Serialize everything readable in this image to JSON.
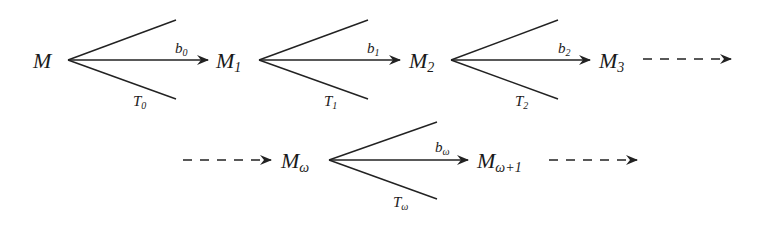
{
  "diagram": {
    "type": "chain-of-forking-morphisms",
    "row1": {
      "nodes": [
        {
          "id": "M",
          "base": "M",
          "sub": ""
        },
        {
          "id": "M1",
          "base": "M",
          "sub": "1"
        },
        {
          "id": "M2",
          "base": "M",
          "sub": "2"
        },
        {
          "id": "M3",
          "base": "M",
          "sub": "3"
        }
      ],
      "forks": [
        {
          "from": "M",
          "to": "M1",
          "arrow_label_base": "b",
          "arrow_label_sub": "0",
          "lower_label_base": "T",
          "lower_label_sub": "0"
        },
        {
          "from": "M1",
          "to": "M2",
          "arrow_label_base": "b",
          "arrow_label_sub": "1",
          "lower_label_base": "T",
          "lower_label_sub": "1"
        },
        {
          "from": "M2",
          "to": "M3",
          "arrow_label_base": "b",
          "arrow_label_sub": "2",
          "lower_label_base": "T",
          "lower_label_sub": "2"
        }
      ],
      "trailing": "dashed-arrow"
    },
    "row2": {
      "leading": "dashed-arrow",
      "nodes": [
        {
          "id": "Momega",
          "base": "M",
          "sub": "ω"
        },
        {
          "id": "Momega1",
          "base": "M",
          "sub": "ω+1"
        }
      ],
      "forks": [
        {
          "from": "Momega",
          "to": "Momega1",
          "arrow_label_base": "b",
          "arrow_label_sub": "ω",
          "lower_label_base": "T",
          "lower_label_sub": "ω"
        }
      ],
      "trailing": "dashed-arrow"
    }
  }
}
